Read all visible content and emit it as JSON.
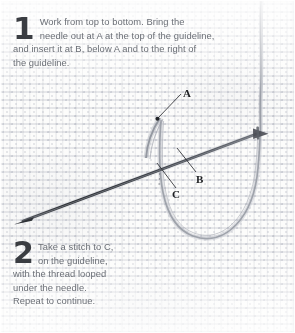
{
  "document": {
    "type": "embroidery-instruction-diagram",
    "background": "woven-fabric-texture"
  },
  "steps": [
    {
      "number": "1",
      "lines": [
        "Work from top to bottom. Bring the",
        "needle out at A at the top of the guideline,",
        "and insert it at B, below A and to the right of",
        "the guideline."
      ]
    },
    {
      "number": "2",
      "lines": [
        "Take a stitch to C,",
        "on the guideline,",
        "with the thread looped",
        "under the needle.",
        "Repeat to continue."
      ]
    }
  ],
  "labels": {
    "a": "A",
    "b": "B",
    "c": "C"
  },
  "illustration": {
    "needle": "sewing-needle",
    "thread": "thread-loop",
    "colors": {
      "needle": "#3c3f45",
      "thread": "#8e939c",
      "label_text": "#1d1f22",
      "body_text": "#6b6f76",
      "fabric": "#fcfcfb"
    }
  }
}
